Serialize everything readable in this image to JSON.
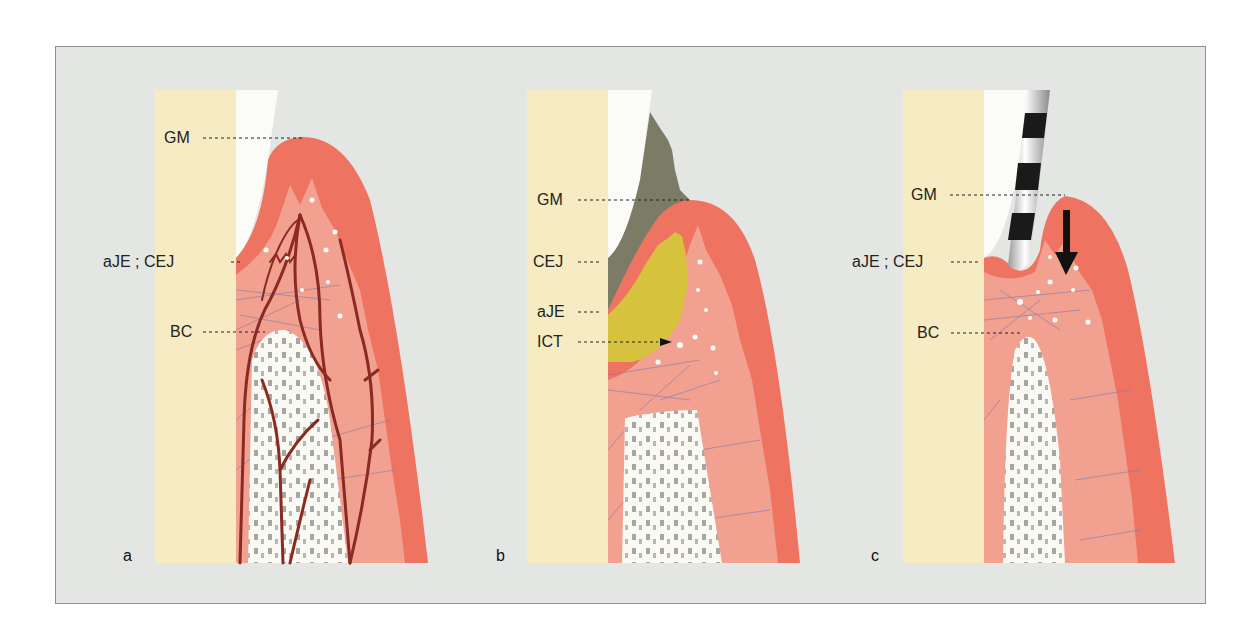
{
  "figure": {
    "panels": [
      {
        "id": "a",
        "letter": "a",
        "labels": [
          {
            "key": "GM",
            "text": "GM"
          },
          {
            "key": "aJE_CEJ",
            "text": "aJE ; CEJ"
          },
          {
            "key": "BC",
            "text": "BC"
          }
        ]
      },
      {
        "id": "b",
        "letter": "b",
        "labels": [
          {
            "key": "GM",
            "text": "GM"
          },
          {
            "key": "CEJ",
            "text": "CEJ"
          },
          {
            "key": "aJE",
            "text": "aJE"
          },
          {
            "key": "ICT",
            "text": "ICT"
          }
        ]
      },
      {
        "id": "c",
        "letter": "c",
        "labels": [
          {
            "key": "GM",
            "text": "GM"
          },
          {
            "key": "aJE_CEJ",
            "text": "aJE ; CEJ"
          },
          {
            "key": "BC",
            "text": "BC"
          }
        ]
      }
    ],
    "colors": {
      "background": "#e3e6e2",
      "dentin": "#f6ebc2",
      "enamel": "#fbfbf8",
      "gingiva_outer": "#ef7361",
      "gingiva_inner": "#f2a090",
      "bone": "#faf9f3",
      "plaque": "#7c7b66",
      "infiltrate": "#d6c23c",
      "vessels": "#8a2a22",
      "fibers": "#7a79b0",
      "probe_dark": "#1a1a1a"
    }
  }
}
